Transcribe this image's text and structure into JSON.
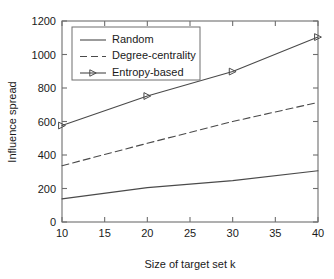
{
  "chart_data": {
    "type": "line",
    "title": "",
    "xlabel": "Size of target set k",
    "ylabel": "Influence spread",
    "x": [
      10,
      20,
      30,
      40
    ],
    "xlim": [
      10,
      40
    ],
    "ylim": [
      0,
      1200
    ],
    "xticks": [
      "10",
      "15",
      "20",
      "25",
      "30",
      "35",
      "40"
    ],
    "xtick_values": [
      10,
      15,
      20,
      25,
      30,
      35,
      40
    ],
    "yticks": [
      "0",
      "200",
      "400",
      "600",
      "800",
      "1000",
      "1200"
    ],
    "ytick_values": [
      0,
      200,
      400,
      600,
      800,
      1000,
      1200
    ],
    "grid": false,
    "legend_position": "top-left",
    "series": [
      {
        "name": "Random",
        "values": [
          138,
          205,
          247,
          306
        ],
        "style": "solid",
        "marker": "none",
        "color": "#4a4a4a"
      },
      {
        "name": "Degree-centrality",
        "values": [
          336,
          470,
          600,
          714
        ],
        "style": "dashed",
        "marker": "none",
        "color": "#4a4a4a"
      },
      {
        "name": "Entropy-based",
        "values": [
          576,
          752,
          898,
          1104
        ],
        "style": "solid",
        "marker": "triangle-right",
        "color": "#4a4a4a"
      }
    ]
  },
  "legend": {
    "entries": [
      {
        "label": "Random"
      },
      {
        "label": "Degree-centrality"
      },
      {
        "label": "Entropy-based"
      }
    ]
  },
  "axes": {
    "x_title": "Size of target set k",
    "y_title": "Influence spread"
  }
}
